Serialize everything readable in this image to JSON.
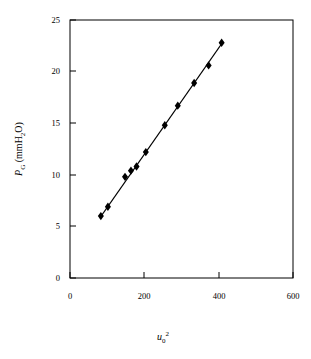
{
  "chart_data": {
    "type": "scatter",
    "title": "",
    "subtitle": "",
    "xlabel": "u0^2",
    "xlabel_parts": {
      "base": "u",
      "subscript": "0",
      "superscript": "2"
    },
    "ylabel": "PG (mmH2O)",
    "ylabel_parts": {
      "base": "P",
      "subscript": "G",
      "unit_pre": " (mmH",
      "unit_sub": "2",
      "unit_post": "O)"
    },
    "xlim": [
      0,
      600
    ],
    "ylim": [
      0,
      25
    ],
    "xticks": [
      0,
      200,
      400,
      600
    ],
    "yticks": [
      0,
      5,
      10,
      15,
      20,
      25
    ],
    "xticklabels": [
      "0",
      "200",
      "400",
      "600"
    ],
    "yticklabels": [
      "0",
      "5",
      "10",
      "15",
      "20",
      "25"
    ],
    "grid": false,
    "legend": false,
    "legend_position": "none",
    "marker": "diamond",
    "marker_color": "#000000",
    "line_color": "#000000",
    "frame_color": "#000000",
    "tick_direction": "in",
    "series": [
      {
        "name": "PG vs u0^2",
        "x": [
          83,
          102,
          148,
          164,
          179,
          204,
          255,
          290,
          334,
          373,
          408
        ],
        "y": [
          6.0,
          6.9,
          9.8,
          10.4,
          10.8,
          12.2,
          14.8,
          16.7,
          18.9,
          20.6,
          22.8
        ]
      }
    ],
    "fit_line": {
      "name": "linear-fit",
      "x": [
        80,
        412
      ],
      "y": [
        5.8,
        22.9
      ]
    }
  }
}
